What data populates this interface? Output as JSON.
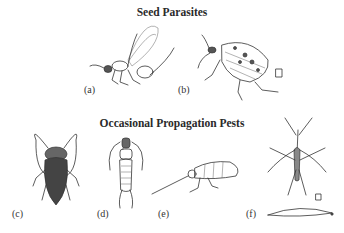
{
  "sections": [
    {
      "title": "Seed Parasites",
      "figures": [
        {
          "label": "(a)",
          "subject": "seed chalcid wasp"
        },
        {
          "label": "(b)",
          "subject": "spotted seed beetle"
        }
      ]
    },
    {
      "title": "Occasional Propagation Pests",
      "figures": [
        {
          "label": "(c)",
          "subject": "cockroach"
        },
        {
          "label": "(d)",
          "subject": "earwig"
        },
        {
          "label": "(e)",
          "subject": "springtail / silverfish-like insect"
        },
        {
          "label": "(f)",
          "subject": "crane fly adult and larva"
        }
      ]
    }
  ],
  "scale_marks": [
    "scale-mark-b",
    "scale-mark-f"
  ]
}
